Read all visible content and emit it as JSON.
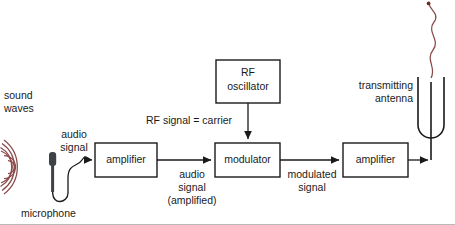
{
  "diagram": {
    "colors": {
      "line": "#1a1a1a",
      "box_stroke": "#1a1a1a",
      "box_fill": "#ffffff",
      "text": "#1a1a1a",
      "sound_wave": "#8a4a4a",
      "radio_wave": "#8a4a4a",
      "microphone_body": "#3c4247",
      "rule": "#b9b9b9"
    },
    "blocks": [
      {
        "id": "amplifier-1",
        "label_line1": "amplifier",
        "x": 95,
        "y": 143,
        "w": 62,
        "h": 34
      },
      {
        "id": "modulator",
        "label_line1": "modulator",
        "x": 215,
        "y": 143,
        "w": 65,
        "h": 34
      },
      {
        "id": "amplifier-2",
        "label_line1": "amplifier",
        "x": 343,
        "y": 143,
        "w": 65,
        "h": 34
      },
      {
        "id": "rf-oscillator",
        "label_line1": "RF",
        "label_line2": "oscillator",
        "x": 216,
        "y": 60,
        "w": 64,
        "h": 43
      }
    ],
    "labels": {
      "sound_waves": "sound\nwaves",
      "microphone": "microphone",
      "audio_signal": "audio\nsignal",
      "audio_signal_amplified": "audio\nsignal\n(amplified)",
      "rf_signal_carrier": "RF signal = carrier",
      "modulated_signal": "modulated\nsignal",
      "transmitting_antenna": "transmitting\nantenna"
    },
    "block_labels": {
      "amplifier_1": "amplifier",
      "modulator": "modulator",
      "amplifier_2": "amplifier",
      "rf_oscillator_line1": "RF",
      "rf_oscillator_line2": "oscillator"
    },
    "icons": {
      "microphone": "microphone-icon",
      "sound_waves": "sound-waves-icon",
      "antenna": "transmitting-antenna-icon",
      "radio_wave": "radio-wave-icon"
    },
    "signal_flow": [
      "microphone -> amplifier",
      "amplifier -> modulator",
      "RF oscillator -> modulator",
      "modulator -> amplifier",
      "amplifier -> transmitting antenna"
    ]
  }
}
